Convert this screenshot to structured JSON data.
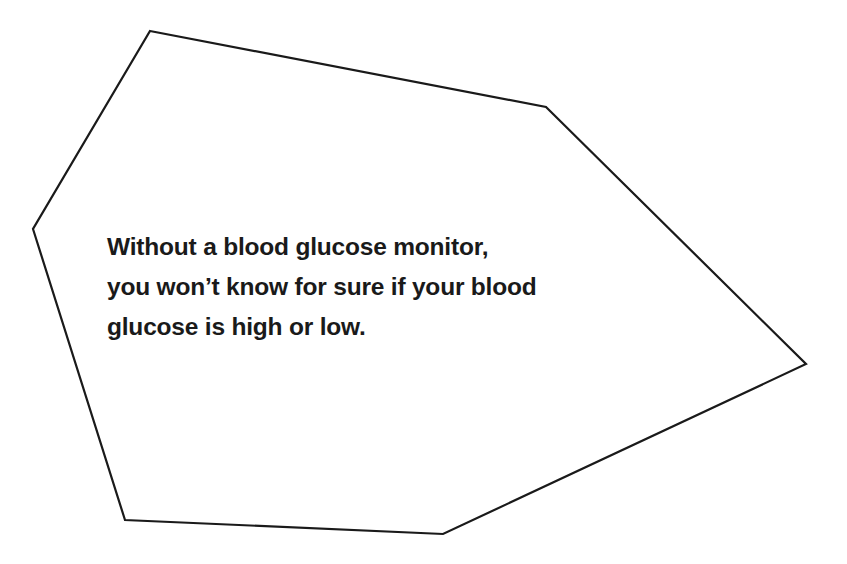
{
  "callout": {
    "lines": [
      "Without a blood glucose monitor,",
      "you won’t know for sure if your blood",
      "glucose is high or low."
    ]
  },
  "shape": {
    "type": "polygon",
    "points": "150,31 546,107 806,364 443,534 125,520 33,229",
    "stroke": "#1a1a1a",
    "fill": "#ffffff"
  }
}
